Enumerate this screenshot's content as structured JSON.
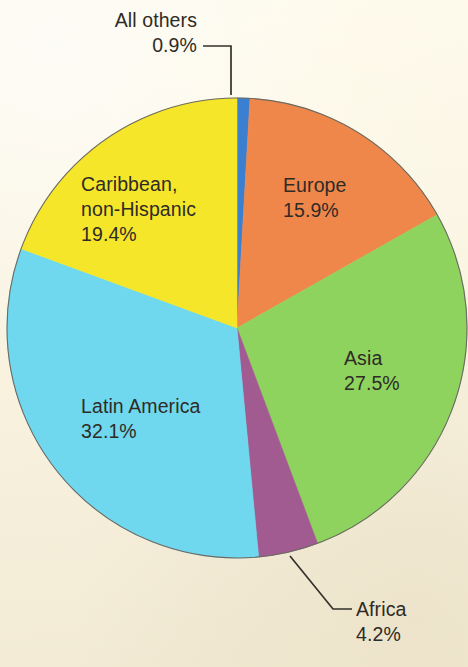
{
  "background_color": "#fbf6e6",
  "chart_data": {
    "type": "pie",
    "title": "",
    "subtitle": "",
    "xlabel": "",
    "ylabel": "",
    "legend_position": "none",
    "grid": false,
    "units": "percent",
    "start_angle_deg": 0,
    "direction": "clockwise",
    "center": {
      "x": 237,
      "y": 328
    },
    "radius": 230,
    "categories": [
      "All others",
      "Europe",
      "Asia",
      "Africa",
      "Latin America",
      "Caribbean, non-Hispanic"
    ],
    "values": [
      0.9,
      15.9,
      27.5,
      4.2,
      32.1,
      19.4
    ],
    "colors": [
      "#3a7fd0",
      "#f0874a",
      "#8ed35e",
      "#a25b91",
      "#6fd8ee",
      "#f5e62a"
    ],
    "slices": [
      {
        "name": "all-others",
        "label": "All others",
        "value_label": "0.9%",
        "value": 0.9,
        "color": "#3a7fd0",
        "label_placement": "callout"
      },
      {
        "name": "europe",
        "label": "Europe",
        "value_label": "15.9%",
        "value": 15.9,
        "color": "#f0874a",
        "label_placement": "inside"
      },
      {
        "name": "asia",
        "label": "Asia",
        "value_label": "27.5%",
        "value": 27.5,
        "color": "#8ed35e",
        "label_placement": "inside"
      },
      {
        "name": "africa",
        "label": "Africa",
        "value_label": "4.2%",
        "value": 4.2,
        "color": "#a25b91",
        "label_placement": "callout"
      },
      {
        "name": "latin-america",
        "label": "Latin America",
        "value_label": "32.1%",
        "value": 32.1,
        "color": "#6fd8ee",
        "label_placement": "inside"
      },
      {
        "name": "caribbean-non-hispanic",
        "label": "Caribbean,",
        "label_line2": "non-Hispanic",
        "value_label": "19.4%",
        "value": 19.4,
        "color": "#f5e62a",
        "label_placement": "inside"
      }
    ]
  },
  "labels": {
    "all_others": {
      "line1": "All others",
      "line2": "0.9%"
    },
    "europe": {
      "line1": "Europe",
      "line2": "15.9%"
    },
    "asia": {
      "line1": "Asia",
      "line2": "27.5%"
    },
    "africa": {
      "line1": "Africa",
      "line2": "4.2%"
    },
    "latin_america": {
      "line1": "Latin America",
      "line2": "32.1%"
    },
    "caribbean": {
      "line1": "Caribbean,",
      "line2": "non-Hispanic",
      "line3": "19.4%"
    }
  }
}
